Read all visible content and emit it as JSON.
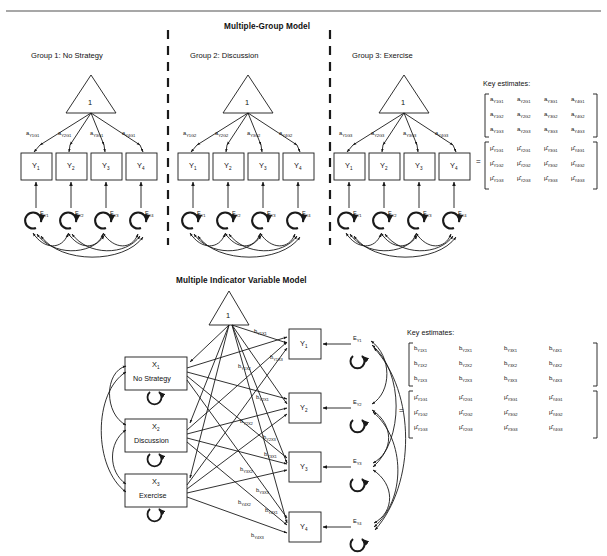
{
  "page": {
    "width": 607,
    "height": 556,
    "background": "#ffffff",
    "rule_color": "#8a8a8a",
    "stroke": "#1a1a1a"
  },
  "top_model": {
    "title": "Multiple-Group Model",
    "groups": [
      {
        "header": "Group 1: No Strategy",
        "constant_label": "1",
        "indicators": [
          "Y",
          "Y",
          "Y",
          "Y"
        ],
        "indicator_subs": [
          "1",
          "2",
          "3",
          "4"
        ],
        "path_labels": [
          {
            "base": "a",
            "sub": "Y1G1"
          },
          {
            "base": "a",
            "sub": "Y2G1"
          },
          {
            "base": "a",
            "sub": "Y3G1"
          },
          {
            "base": "a",
            "sub": "Y4G1"
          }
        ],
        "errors": [
          {
            "base": "E",
            "sub": "Y1"
          },
          {
            "base": "E",
            "sub": "Y2"
          },
          {
            "base": "E",
            "sub": "Y3"
          },
          {
            "base": "E",
            "sub": "Y4"
          }
        ]
      },
      {
        "header": "Group 2: Discussion",
        "constant_label": "1",
        "indicators": [
          "Y",
          "Y",
          "Y",
          "Y"
        ],
        "indicator_subs": [
          "1",
          "2",
          "3",
          "4"
        ],
        "path_labels": [
          {
            "base": "a",
            "sub": "Y1G2"
          },
          {
            "base": "a",
            "sub": "Y2G2"
          },
          {
            "base": "a",
            "sub": "Y3G2"
          },
          {
            "base": "a",
            "sub": "Y4G2"
          }
        ],
        "errors": [
          {
            "base": "E",
            "sub": "Y1"
          },
          {
            "base": "E",
            "sub": "Y2"
          },
          {
            "base": "E",
            "sub": "Y3"
          },
          {
            "base": "E",
            "sub": "Y4"
          }
        ]
      },
      {
        "header": "Group 3: Exercise",
        "constant_label": "1",
        "indicators": [
          "Y",
          "Y",
          "Y",
          "Y"
        ],
        "indicator_subs": [
          "1",
          "2",
          "3",
          "4"
        ],
        "path_labels": [
          {
            "base": "a",
            "sub": "Y1G3"
          },
          {
            "base": "a",
            "sub": "Y2G3"
          },
          {
            "base": "a",
            "sub": "Y3G3"
          },
          {
            "base": "a",
            "sub": "Y4G3"
          }
        ],
        "errors": [
          {
            "base": "E",
            "sub": "Y1"
          },
          {
            "base": "E",
            "sub": "Y2"
          },
          {
            "base": "E",
            "sub": "Y3"
          },
          {
            "base": "E",
            "sub": "Y4"
          }
        ]
      }
    ],
    "key_estimates": {
      "caption": "Key estimates:",
      "equals": "=",
      "matrix_a": [
        [
          {
            "b": "a",
            "s": "Y1G1"
          },
          {
            "b": "a",
            "s": "Y2G1"
          },
          {
            "b": "a",
            "s": "Y3G1"
          },
          {
            "b": "a",
            "s": "Y4G1"
          }
        ],
        [
          {
            "b": "a",
            "s": "Y1G2"
          },
          {
            "b": "a",
            "s": "Y2G2"
          },
          {
            "b": "a",
            "s": "Y3G2"
          },
          {
            "b": "a",
            "s": "Y4G2"
          }
        ],
        [
          {
            "b": "a",
            "s": "Y1G3"
          },
          {
            "b": "a",
            "s": "Y2G3"
          },
          {
            "b": "a",
            "s": "Y3G3"
          },
          {
            "b": "a",
            "s": "Y4G3"
          }
        ]
      ],
      "matrix_mu": [
        [
          {
            "b": "μ̂",
            "s": "Y1G1"
          },
          {
            "b": "μ̂",
            "s": "Y2G1"
          },
          {
            "b": "μ̂",
            "s": "Y3G1"
          },
          {
            "b": "μ̂",
            "s": "Y4G1"
          }
        ],
        [
          {
            "b": "μ̂",
            "s": "Y1G2"
          },
          {
            "b": "μ̂",
            "s": "Y2G2"
          },
          {
            "b": "μ̂",
            "s": "Y3G2"
          },
          {
            "b": "μ̂",
            "s": "Y4G2"
          }
        ],
        [
          {
            "b": "μ̂",
            "s": "Y1G3"
          },
          {
            "b": "μ̂",
            "s": "Y2G3"
          },
          {
            "b": "μ̂",
            "s": "Y3G3"
          },
          {
            "b": "μ̂",
            "s": "Y4G3"
          }
        ]
      ]
    }
  },
  "bottom_model": {
    "title": "Multiple Indicator Variable Model",
    "constant_label": "1",
    "exogenous": [
      {
        "base": "X",
        "sub": "1",
        "name": "No Strategy"
      },
      {
        "base": "X",
        "sub": "2",
        "name": "Discussion"
      },
      {
        "base": "X",
        "sub": "3",
        "name": "Exercise"
      }
    ],
    "indicators": [
      {
        "base": "Y",
        "sub": "1"
      },
      {
        "base": "Y",
        "sub": "2"
      },
      {
        "base": "Y",
        "sub": "3"
      },
      {
        "base": "Y",
        "sub": "4"
      }
    ],
    "errors": [
      {
        "base": "E",
        "sub": "Y1"
      },
      {
        "base": "E",
        "sub": "Y2"
      },
      {
        "base": "E",
        "sub": "Y3"
      },
      {
        "base": "E",
        "sub": "Y4"
      }
    ],
    "path_labels": [
      {
        "base": "b",
        "sub": "Y1X1"
      },
      {
        "base": "b",
        "sub": "Y1X2"
      },
      {
        "base": "b",
        "sub": "Y1X3"
      },
      {
        "base": "b",
        "sub": "Y2X1"
      },
      {
        "base": "b",
        "sub": "Y2X2"
      },
      {
        "base": "b",
        "sub": "Y2X3"
      },
      {
        "base": "b",
        "sub": "Y3X1"
      },
      {
        "base": "b",
        "sub": "Y3X2"
      },
      {
        "base": "b",
        "sub": "Y3X3"
      },
      {
        "base": "b",
        "sub": "Y4X1"
      },
      {
        "base": "b",
        "sub": "Y4X2"
      },
      {
        "base": "b",
        "sub": "Y4X3"
      }
    ],
    "key_estimates": {
      "caption": "Key estimates:",
      "equals": "=",
      "matrix_b": [
        [
          {
            "b": "b",
            "s": "Y1X1"
          },
          {
            "b": "b",
            "s": "Y2X1"
          },
          {
            "b": "b",
            "s": "Y3X1"
          },
          {
            "b": "b",
            "s": "Y4X1"
          }
        ],
        [
          {
            "b": "b",
            "s": "Y1X2"
          },
          {
            "b": "b",
            "s": "Y2X2"
          },
          {
            "b": "b",
            "s": "Y3X2"
          },
          {
            "b": "b",
            "s": "Y4X2"
          }
        ],
        [
          {
            "b": "b",
            "s": "Y1X3"
          },
          {
            "b": "b",
            "s": "Y2X3"
          },
          {
            "b": "b",
            "s": "Y3X3"
          },
          {
            "b": "b",
            "s": "Y4X3"
          }
        ]
      ],
      "matrix_mu": [
        [
          {
            "b": "μ̂",
            "s": "Y1G1"
          },
          {
            "b": "μ̂",
            "s": "Y2G1"
          },
          {
            "b": "μ̂",
            "s": "Y3G1"
          },
          {
            "b": "μ̂",
            "s": "Y4G1"
          }
        ],
        [
          {
            "b": "μ̂",
            "s": "Y1G2"
          },
          {
            "b": "μ̂",
            "s": "Y2G2"
          },
          {
            "b": "μ̂",
            "s": "Y3G2"
          },
          {
            "b": "μ̂",
            "s": "Y4G2"
          }
        ],
        [
          {
            "b": "μ̂",
            "s": "Y1G3"
          },
          {
            "b": "μ̂",
            "s": "Y2G3"
          },
          {
            "b": "μ̂",
            "s": "Y3G3"
          },
          {
            "b": "μ̂",
            "s": "Y4G3"
          }
        ]
      ]
    }
  }
}
